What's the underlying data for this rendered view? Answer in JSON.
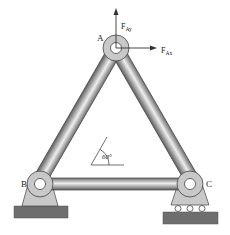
{
  "diagram": {
    "type": "truss",
    "joints": {
      "A": {
        "label": "A",
        "x": 116,
        "y": 48
      },
      "B": {
        "label": "B",
        "x": 40,
        "y": 184
      },
      "C": {
        "label": "C",
        "x": 190,
        "y": 184
      }
    },
    "members": [
      {
        "from": "A",
        "to": "B"
      },
      {
        "from": "A",
        "to": "C"
      },
      {
        "from": "B",
        "to": "C"
      }
    ],
    "forces": {
      "Fay": {
        "symbol": "F",
        "subscript": "Ay",
        "direction": "up"
      },
      "Fax": {
        "symbol": "F",
        "subscript": "Ax",
        "direction": "right"
      }
    },
    "angle": {
      "label": "60°"
    },
    "supports": {
      "B": "pin",
      "C": "roller"
    },
    "colors": {
      "member": "#9a9a9a",
      "joint": "#c8c8c8",
      "support": "#c8c8c8",
      "ground": "#6e6e6e",
      "line": "#333333"
    }
  }
}
